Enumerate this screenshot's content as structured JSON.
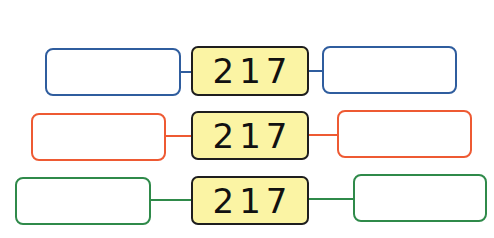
{
  "colors": {
    "row1": "#2f5d9e",
    "row2": "#ee5a33",
    "row3": "#2f8a4a",
    "center_fill": "#fbf4a4",
    "center_border": "#1e1e1e"
  },
  "rows": [
    {
      "value": "217",
      "left_answer": "",
      "right_answer": ""
    },
    {
      "value": "217",
      "left_answer": "",
      "right_answer": ""
    },
    {
      "value": "217",
      "left_answer": "",
      "right_answer": ""
    }
  ]
}
